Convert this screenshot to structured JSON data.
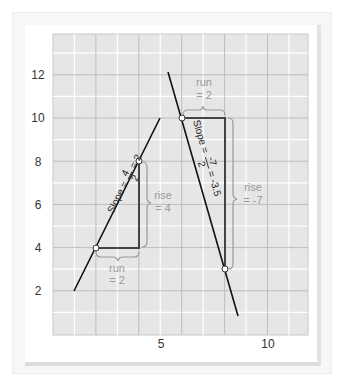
{
  "chart_data": {
    "type": "line",
    "title": "",
    "xlabel": "",
    "ylabel": "",
    "xlim": [
      0,
      12
    ],
    "ylim": [
      0,
      14
    ],
    "x_ticks": [
      "5",
      "10"
    ],
    "y_ticks": [
      "2",
      "4",
      "6",
      "8",
      "10",
      "12"
    ],
    "grid": true,
    "series": [
      {
        "name": "Line with slope 2",
        "x": [
          1,
          5
        ],
        "y": [
          2,
          10
        ],
        "points": [
          {
            "x": 2,
            "y": 4
          },
          {
            "x": 4,
            "y": 8
          }
        ],
        "slope": 2
      },
      {
        "name": "Line with slope -3.5",
        "x": [
          5.3,
          8.6
        ],
        "y": [
          12.5,
          0.9
        ],
        "points": [
          {
            "x": 6,
            "y": 10
          },
          {
            "x": 8,
            "y": 3
          }
        ],
        "slope": -3.5
      }
    ],
    "annotations": [
      {
        "text": "Slope = 4/2 = 2"
      },
      {
        "text": "rise = 4"
      },
      {
        "text": "run = 2"
      },
      {
        "text": "Slope = -7/2 = -3.5"
      },
      {
        "text": "run = 2"
      },
      {
        "text": "rise = -7"
      }
    ]
  },
  "axes": {
    "y_labels": [
      "12",
      "10",
      "8",
      "6",
      "4",
      "2"
    ],
    "x_labels": [
      "5",
      "10"
    ]
  },
  "left_line": {
    "slope_word": "Slope =",
    "num": "4",
    "den": "2",
    "result": "= 2",
    "rise_word": "rise",
    "rise_val": "= 4",
    "run_word": "run",
    "run_val": "= 2"
  },
  "right_line": {
    "slope_word": "Slope =",
    "num": "-7",
    "den": "2",
    "result": "= -3.5",
    "rise_word": "rise",
    "rise_val": "= -7",
    "run_word": "run",
    "run_val": "= 2"
  },
  "colors": {
    "grid_bg": "#e6e6e6",
    "grid_minor": "#ffffff",
    "grid_major": "#bdbdbd",
    "line": "#111111",
    "triangle": "#444444",
    "annotation": "#9a9a9a"
  }
}
